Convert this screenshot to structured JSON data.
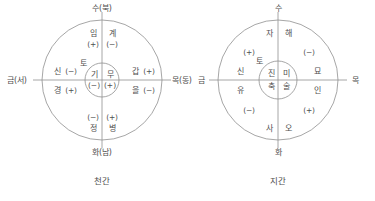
{
  "figure": {
    "title_visible": false,
    "stroke_color": "#8f8f8f",
    "text_color": "#4f4f4f",
    "background": "#ffffff"
  },
  "diagrams": [
    {
      "id": "cheongan",
      "caption": "천간",
      "outer_labels": {
        "top": "수(북)",
        "left": "금(서)",
        "right": "목(동)",
        "bottom": "화(남)",
        "center": "토"
      },
      "quadrants": [
        {
          "position": "top-left",
          "stem": "임",
          "sign": "(+)"
        },
        {
          "position": "top-right",
          "stem": "계",
          "sign": "(−)"
        },
        {
          "position": "left-upper",
          "stem": "신",
          "sign": "(−)"
        },
        {
          "position": "left-lower",
          "stem": "경",
          "sign": "(+)"
        },
        {
          "position": "right-upper",
          "stem": "갑",
          "sign": "(+)"
        },
        {
          "position": "right-lower",
          "stem": "을",
          "sign": "(−)"
        },
        {
          "position": "bottom-left",
          "stem": "정",
          "sign": "(−)"
        },
        {
          "position": "bottom-right",
          "stem": "병",
          "sign": "(+)"
        }
      ],
      "center_cells": [
        {
          "position": "left",
          "stem": "기",
          "sign": "(−)"
        },
        {
          "position": "right",
          "stem": "무",
          "sign": "(+)"
        }
      ]
    },
    {
      "id": "jigan",
      "caption": "지간",
      "outer_labels": {
        "top": "수",
        "left": "금",
        "right": "목",
        "bottom": "화",
        "center": "토"
      },
      "quadrants": [
        {
          "position": "top-left",
          "branch": "자",
          "sign": "(+)"
        },
        {
          "position": "top-right",
          "branch": "해",
          "sign": "(−)"
        },
        {
          "position": "left-upper",
          "branch": "신",
          "sign": ""
        },
        {
          "position": "left-lower",
          "branch": "유",
          "sign": ""
        },
        {
          "position": "right-upper",
          "branch": "묘",
          "sign": ""
        },
        {
          "position": "right-lower",
          "branch": "인",
          "sign": ""
        },
        {
          "position": "bottom-left",
          "branch": "사",
          "sign": "(−)"
        },
        {
          "position": "bottom-right",
          "branch": "오",
          "sign": "(+)"
        }
      ],
      "center_cells": [
        {
          "position": "top-left",
          "branch": "진"
        },
        {
          "position": "top-right",
          "branch": "미"
        },
        {
          "position": "bottom-left",
          "branch": "축"
        },
        {
          "position": "bottom-right",
          "branch": "술"
        }
      ]
    }
  ]
}
